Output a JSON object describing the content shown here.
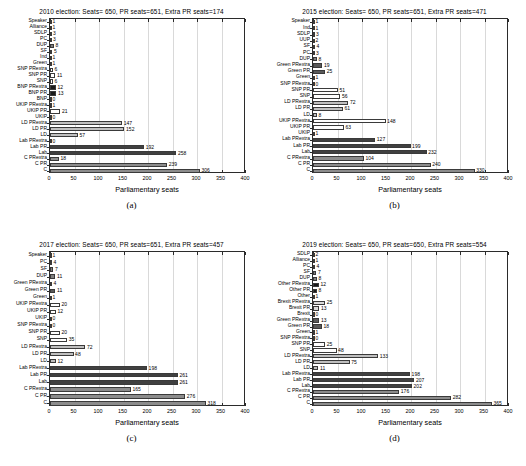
{
  "figure": {
    "axis_label": "Parliamentary seats",
    "xticks": [
      0,
      50,
      100,
      150,
      200,
      250,
      300,
      350,
      400
    ],
    "xlim": [
      0,
      400
    ],
    "colors": {
      "conservative": "#8c8c8c",
      "labour": "#404040",
      "libdem": "#bfbfbf",
      "ukip": "#ffffff",
      "snp": "#ffffff",
      "green": "#595959",
      "brexit": "#d9d9d9",
      "other": "#1a1a1a",
      "small": "#808080",
      "grid": "#d9d9d9",
      "axis": "#2b2b2b"
    }
  },
  "panels": [
    {
      "id": "a",
      "caption": "(a)",
      "title": "2010 election: Seats= 650, PR seats=651, Extra PR seats=174",
      "chart_data": {
        "type": "bar",
        "orientation": "horizontal",
        "title": "2010 election: Seats= 650, PR seats=651, Extra PR seats=174",
        "xlabel": "Parliamentary seats",
        "ylabel": "",
        "xlim": [
          0,
          400
        ],
        "grid": true,
        "categories": [
          "C",
          "C PR",
          "C PRextra",
          "Lab",
          "Lab PR",
          "Lab PRextra",
          "LD",
          "LD PR",
          "LD PRextra",
          "UKIP",
          "UKIP PR",
          "UKIP PRextra",
          "BNP",
          "BNP PR",
          "BNP PRextra",
          "SNP",
          "SNP PR",
          "SNP PRextra",
          "Green",
          "Ind",
          "SF",
          "DUP",
          "PC",
          "SDLP",
          "Alliance",
          "Speaker"
        ],
        "values": [
          306,
          239,
          18,
          258,
          192,
          0,
          57,
          152,
          147,
          0,
          21,
          1,
          0,
          13,
          12,
          6,
          11,
          6,
          1,
          1,
          5,
          8,
          3,
          3,
          1,
          1
        ],
        "series_color": [
          "conservative",
          "conservative",
          "conservative",
          "labour",
          "labour",
          "labour",
          "libdem",
          "libdem",
          "libdem",
          "ukip",
          "ukip",
          "ukip",
          "other",
          "other",
          "other",
          "snp",
          "snp",
          "snp",
          "small",
          "small",
          "small",
          "small",
          "small",
          "small",
          "small",
          "small"
        ]
      }
    },
    {
      "id": "b",
      "caption": "(b)",
      "title": "2015 election: Seats= 650, PR seats=651, Extra PR seats=471",
      "chart_data": {
        "type": "bar",
        "orientation": "horizontal",
        "title": "2015 election: Seats= 650, PR seats=651, Extra PR seats=471",
        "xlabel": "Parliamentary seats",
        "ylabel": "",
        "xlim": [
          0,
          400
        ],
        "grid": true,
        "categories": [
          "C",
          "C PR",
          "C PRextra",
          "Lab",
          "Lab PR",
          "Lab PRextra",
          "UKIP",
          "UKIP PR",
          "UKIP PRextra",
          "LD",
          "LD PR",
          "LD PRextra",
          "SNP",
          "SNP PR",
          "SNP PRextra",
          "Green",
          "Green PR",
          "Green PRextra",
          "DUP",
          "PC",
          "SF",
          "UUP",
          "SDLP",
          "Ind",
          "Speaker"
        ],
        "values": [
          330,
          240,
          104,
          232,
          199,
          127,
          1,
          63,
          148,
          8,
          61,
          72,
          56,
          51,
          0,
          1,
          25,
          19,
          8,
          3,
          4,
          2,
          3,
          1,
          1
        ],
        "series_color": [
          "conservative",
          "conservative",
          "conservative",
          "labour",
          "labour",
          "labour",
          "ukip",
          "ukip",
          "ukip",
          "libdem",
          "libdem",
          "libdem",
          "snp",
          "snp",
          "snp",
          "green",
          "green",
          "green",
          "small",
          "small",
          "small",
          "small",
          "small",
          "small",
          "small"
        ]
      }
    },
    {
      "id": "c",
      "caption": "(c)",
      "title": "2017 election: Seats= 650, PR seats=651, Extra PR seats=457",
      "chart_data": {
        "type": "bar",
        "orientation": "horizontal",
        "title": "2017 election: Seats= 650, PR seats=651, Extra PR seats=457",
        "xlabel": "Parliamentary seats",
        "ylabel": "",
        "xlim": [
          0,
          400
        ],
        "grid": true,
        "categories": [
          "C",
          "C PR",
          "C PRextra",
          "Lab",
          "Lab PR",
          "Lab PRextra",
          "LD",
          "LD PR",
          "LD PRextra",
          "SNP",
          "SNP PR",
          "SNP PRextra",
          "UKIP",
          "UKIP PR",
          "UKIP PRextra",
          "Green",
          "Green PR",
          "Green PRextra",
          "DUP",
          "SF",
          "PC",
          "Speaker"
        ],
        "values": [
          318,
          276,
          165,
          261,
          261,
          198,
          12,
          48,
          72,
          35,
          20,
          0,
          0,
          12,
          20,
          1,
          11,
          4,
          11,
          7,
          4,
          1
        ],
        "series_color": [
          "conservative",
          "conservative",
          "conservative",
          "labour",
          "labour",
          "labour",
          "libdem",
          "libdem",
          "libdem",
          "snp",
          "snp",
          "snp",
          "ukip",
          "ukip",
          "ukip",
          "green",
          "green",
          "green",
          "small",
          "small",
          "small",
          "small"
        ]
      }
    },
    {
      "id": "d",
      "caption": "(d)",
      "title": "2019 election: Seats= 650, PR seats=650, Extra PR seats=554",
      "chart_data": {
        "type": "bar",
        "orientation": "horizontal",
        "title": "2019 election: Seats= 650, PR seats=650, Extra PR seats=554",
        "xlabel": "Parliamentary seats",
        "ylabel": "",
        "xlim": [
          0,
          400
        ],
        "grid": true,
        "categories": [
          "C",
          "C PR",
          "C PRextra",
          "Lab",
          "Lab PR",
          "Lab PRextra",
          "LD",
          "LD PR",
          "LD PRextra",
          "SNP",
          "SNP PR",
          "SNP PRextra",
          "Green",
          "Green PR",
          "Green PRextra",
          "Brexit",
          "Brexit PR",
          "Brexit PRextra",
          "Other",
          "Other PR",
          "Other PRextra",
          "DUP",
          "SF",
          "PC",
          "Alliance",
          "SDLP"
        ],
        "values": [
          365,
          282,
          176,
          202,
          207,
          198,
          11,
          75,
          133,
          48,
          25,
          0,
          1,
          18,
          13,
          0,
          13,
          25,
          1,
          8,
          12,
          8,
          7,
          4,
          1,
          2
        ],
        "series_color": [
          "conservative",
          "conservative",
          "conservative",
          "labour",
          "labour",
          "labour",
          "libdem",
          "libdem",
          "libdem",
          "snp",
          "snp",
          "snp",
          "green",
          "green",
          "green",
          "brexit",
          "brexit",
          "brexit",
          "other",
          "other",
          "other",
          "small",
          "small",
          "small",
          "small",
          "small"
        ]
      }
    }
  ]
}
